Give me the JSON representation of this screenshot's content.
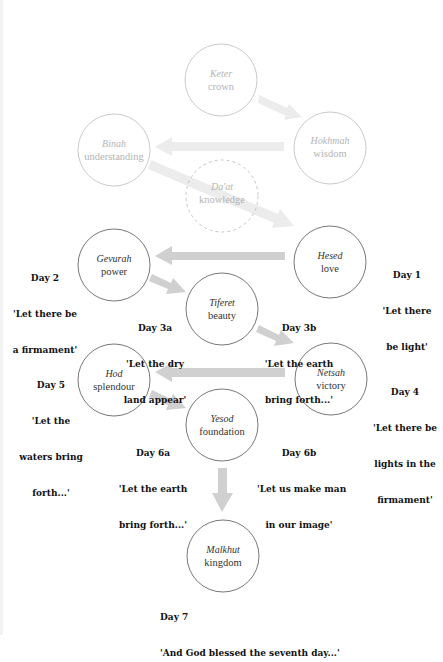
{
  "colors": {
    "circle_strong": "#555555",
    "circle_faded": "#bdbdbd",
    "arrow_strong": "#d0d0d0",
    "arrow_faded": "#ececec",
    "text_strong": "#333333",
    "text_faded": "#b4b4b4",
    "day_text": "#111111"
  },
  "nodes": [
    {
      "id": "keter",
      "name": "Keter",
      "meaning": "crown",
      "cx": 221,
      "cy": 80,
      "style": "faded"
    },
    {
      "id": "hokhmah",
      "name": "Hokhmah",
      "meaning": "wisdom",
      "cx": 330,
      "cy": 148,
      "style": "faded"
    },
    {
      "id": "binah",
      "name": "Binah",
      "meaning": "understanding",
      "cx": 114,
      "cy": 150,
      "style": "faded"
    },
    {
      "id": "daat",
      "name": "Da'at",
      "meaning": "knowledge",
      "cx": 222,
      "cy": 196,
      "style": "faded-dashed"
    },
    {
      "id": "gevurah",
      "name": "Gevurah",
      "meaning": "power",
      "cx": 114,
      "cy": 265,
      "style": "strong"
    },
    {
      "id": "hesed",
      "name": "Hesed",
      "meaning": "love",
      "cx": 330,
      "cy": 262,
      "style": "strong"
    },
    {
      "id": "tiferet",
      "name": "Tiferet",
      "meaning": "beauty",
      "cx": 222,
      "cy": 309,
      "style": "strong"
    },
    {
      "id": "hod",
      "name": "Hod",
      "meaning": "splendour",
      "cx": 114,
      "cy": 380,
      "style": "strong"
    },
    {
      "id": "netsah",
      "name": "Netsah",
      "meaning": "victory",
      "cx": 331,
      "cy": 379,
      "style": "strong"
    },
    {
      "id": "yesod",
      "name": "Yesod",
      "meaning": "foundation",
      "cx": 222,
      "cy": 425,
      "style": "strong"
    },
    {
      "id": "malkhut",
      "name": "Malkhut",
      "meaning": "kingdom",
      "cx": 223,
      "cy": 556,
      "style": "strong"
    }
  ],
  "arrows": [
    {
      "from": "keter",
      "to": "hokhmah",
      "style": "faded"
    },
    {
      "from": "hokhmah",
      "to": "binah",
      "style": "faded"
    },
    {
      "from": "binah",
      "to": "hesed",
      "style": "faded"
    },
    {
      "from": "hesed",
      "to": "gevurah",
      "style": "strong"
    },
    {
      "from": "gevurah",
      "to": "tiferet",
      "style": "strong"
    },
    {
      "from": "tiferet",
      "to": "netsah",
      "style": "strong"
    },
    {
      "from": "netsah",
      "to": "hod",
      "style": "strong"
    },
    {
      "from": "hod",
      "to": "yesod",
      "style": "strong"
    },
    {
      "from": "yesod",
      "to": "malkhut",
      "style": "strong"
    }
  ],
  "days": [
    {
      "id": "day1",
      "title": "Day 1",
      "lines": [
        "'Let there",
        "be light'"
      ]
    },
    {
      "id": "day2",
      "title": "Day 2",
      "lines": [
        "'Let there be",
        "a firmament'"
      ]
    },
    {
      "id": "day3a",
      "title": "Day 3a",
      "lines": [
        "'Let the dry",
        "land appear'"
      ]
    },
    {
      "id": "day3b",
      "title": "Day 3b",
      "lines": [
        "'Let the earth",
        "bring forth...'"
      ]
    },
    {
      "id": "day4",
      "title": "Day 4",
      "lines": [
        "'Let there be",
        "lights in the",
        "firmament'"
      ]
    },
    {
      "id": "day5",
      "title": "Day 5",
      "lines": [
        "'Let the",
        "waters bring",
        "forth...'"
      ]
    },
    {
      "id": "day6a",
      "title": "Day 6a",
      "lines": [
        "'Let the earth",
        "bring forth...'"
      ]
    },
    {
      "id": "day6b",
      "title": "Day 6b",
      "lines": [
        "'Let us make man",
        "in our image'"
      ]
    },
    {
      "id": "day7",
      "title": "Day 7",
      "lines": [
        "'And God blessed the seventh day...'"
      ]
    }
  ]
}
